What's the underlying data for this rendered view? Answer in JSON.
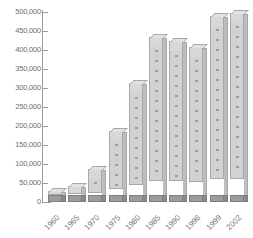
{
  "chart_data": {
    "type": "bar",
    "title": "",
    "subtitle": "",
    "xlabel": "",
    "ylabel": "",
    "categories": [
      "1960",
      "1965",
      "1970",
      "1975",
      "1980",
      "1985",
      "1990",
      "1996",
      "1999",
      "2002"
    ],
    "values": [
      26000,
      40000,
      85000,
      185000,
      310000,
      432000,
      421000,
      406000,
      487000,
      495000
    ],
    "ylim": [
      0,
      500000
    ],
    "y_ticks": [
      "500,000",
      "450,000",
      "400,000",
      "350,000",
      "300,000",
      "250,000",
      "200,000",
      "150,000",
      "100,000",
      "50,000",
      "0"
    ],
    "y_tick_values": [
      500000,
      450000,
      400000,
      350000,
      300000,
      250000,
      200000,
      150000,
      100000,
      50000,
      0
    ],
    "grid": false,
    "legend": null,
    "series": [
      {
        "name": "",
        "values": [
          26000,
          40000,
          85000,
          185000,
          310000,
          432000,
          421000,
          406000,
          487000,
          495000
        ]
      }
    ],
    "bar_style": "stacked-3d-drawer-blocks",
    "colors": {
      "bar_fill": "#d2d2d2",
      "bar_edge": "#a8a8a8",
      "bar_top_face": "#e2e2e2",
      "bar_side_face": "#bdbdbd",
      "bar_base": "#9c9c9c",
      "axis": "#9a9a9a",
      "tick_label": "#6e6e6e",
      "category_label": "#7a7a7a",
      "background": "#ffffff"
    }
  },
  "caption": {
    "text": ""
  }
}
